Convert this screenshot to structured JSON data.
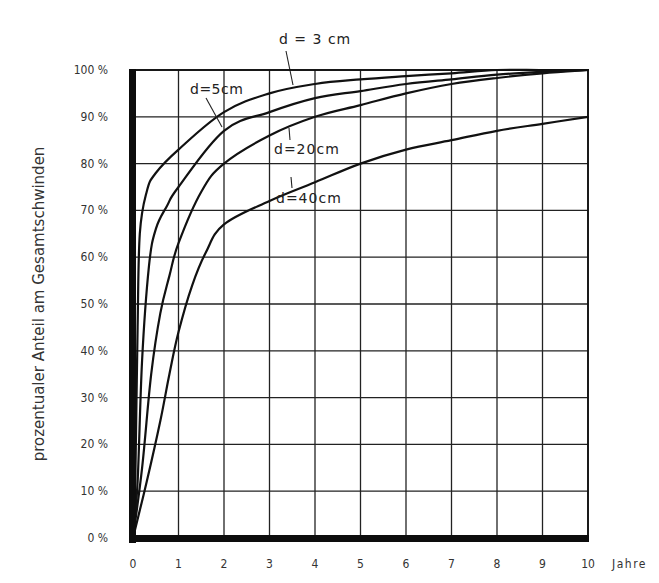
{
  "chart_data": {
    "type": "line",
    "title": "",
    "xlabel": "Jahre",
    "ylabel": "prozentualer Anteil am Gesamtschwinden",
    "xlim": [
      0,
      10
    ],
    "ylim": [
      0,
      100
    ],
    "grid": true,
    "legend_position": "inline labels on curves",
    "x_ticks": [
      "0",
      "1",
      "2",
      "3",
      "4",
      "5",
      "6",
      "7",
      "8",
      "9",
      "10"
    ],
    "y_ticks": [
      "0 %",
      "10 %",
      "20 %",
      "30 %",
      "40 %",
      "50 %",
      "60 %",
      "70 %",
      "80 %",
      "90 %",
      "100 %"
    ],
    "series": [
      {
        "name": "d = 3 cm",
        "x": [
          0,
          0.05,
          0.1,
          0.15,
          0.3,
          0.5,
          1,
          2,
          3,
          4,
          5,
          6,
          7,
          8,
          9,
          10
        ],
        "values": [
          0,
          12,
          45,
          65,
          74,
          78,
          83,
          91,
          95,
          97,
          98,
          98.7,
          99.3,
          100,
          100,
          100
        ]
      },
      {
        "name": "d = 5 cm",
        "x": [
          0,
          0.1,
          0.2,
          0.35,
          0.5,
          0.75,
          1,
          2,
          3,
          4,
          5,
          6,
          7,
          8,
          9,
          10
        ],
        "values": [
          0,
          12,
          38,
          58,
          66,
          71,
          75,
          87,
          91,
          94,
          95.5,
          97,
          98,
          99,
          99.6,
          100
        ]
      },
      {
        "name": "d = 20 cm",
        "x": [
          0,
          0.2,
          0.4,
          0.6,
          0.8,
          1,
          1.5,
          2,
          3,
          4,
          5,
          6,
          7,
          8,
          9,
          10
        ],
        "values": [
          0,
          15,
          35,
          48,
          56,
          63,
          74,
          80,
          86,
          90,
          92.5,
          95,
          97,
          98.3,
          99.3,
          100
        ]
      },
      {
        "name": "d = 40 cm",
        "x": [
          0,
          0.3,
          0.6,
          0.8,
          1,
          1.3,
          1.6,
          2,
          3,
          4,
          5,
          6,
          7,
          8,
          9,
          10
        ],
        "values": [
          0,
          12,
          25,
          35,
          44,
          54,
          61,
          67,
          72,
          76,
          80,
          83,
          85,
          87,
          88.5,
          90
        ]
      }
    ],
    "annotations": [
      {
        "text": "d = 3 cm",
        "points_to": "d = 3 cm"
      },
      {
        "text": "d=5cm",
        "points_to": "d = 5 cm"
      },
      {
        "text": "d=20cm",
        "points_to": "d = 20 cm"
      },
      {
        "text": "d=40cm",
        "points_to": "d = 40 cm"
      }
    ]
  },
  "labels": {
    "ylabel": "prozentualer Anteil am Gesamtschwinden",
    "xunit": "Jahre",
    "curve_3": "d = 3 cm",
    "curve_5": "d=5cm",
    "curve_20": "d=20cm",
    "curve_40": "d=40cm"
  }
}
